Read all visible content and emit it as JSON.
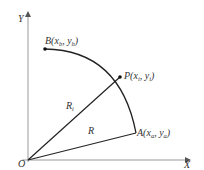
{
  "diagram": {
    "axes": {
      "x_label": "X",
      "y_label": "Y",
      "origin_label": "O"
    },
    "points": {
      "B": {
        "name": "B",
        "open": "(",
        "x": "x",
        "x_sub": "b",
        "sep": ", ",
        "y": "y",
        "y_sub": "b",
        "close": ")"
      },
      "P": {
        "name": "P",
        "open": "(",
        "x": "x",
        "x_sub": "i",
        "sep": ", ",
        "y": "y",
        "y_sub": "i",
        "close": ")"
      },
      "A": {
        "name": "A",
        "open": "(",
        "x": "x",
        "x_sub": "a",
        "sep": ", ",
        "y": "y",
        "y_sub": "a",
        "close": ")"
      }
    },
    "segments": {
      "R1": {
        "label": "R",
        "sub": "i"
      },
      "R": {
        "label": "R"
      }
    },
    "colors": {
      "axis": "#999999",
      "line": "#222222",
      "text": "#333333"
    }
  }
}
